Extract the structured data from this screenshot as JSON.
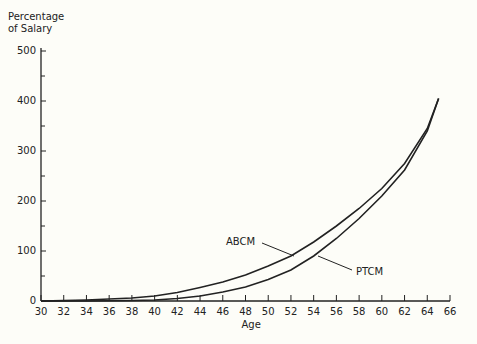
{
  "chart_data": {
    "type": "line",
    "title": "",
    "ylabel": "Percentage of Salary",
    "ylabel_lines": [
      "Percentage",
      "of Salary"
    ],
    "xlabel": "Age",
    "xlim": [
      30,
      66
    ],
    "ylim": [
      0,
      500
    ],
    "x_ticks": [
      30,
      32,
      34,
      36,
      38,
      40,
      42,
      44,
      46,
      48,
      50,
      52,
      54,
      56,
      58,
      60,
      62,
      64,
      66
    ],
    "y_ticks": [
      0,
      100,
      200,
      300,
      400,
      500
    ],
    "grid": false,
    "series": [
      {
        "name": "ABCM",
        "x": [
          30,
          34,
          38,
          40,
          42,
          44,
          46,
          48,
          50,
          52,
          54,
          56,
          58,
          60,
          62,
          64,
          65
        ],
        "values": [
          0,
          2,
          6,
          10,
          17,
          27,
          38,
          52,
          70,
          90,
          118,
          150,
          185,
          225,
          275,
          345,
          405
        ]
      },
      {
        "name": "PTCM",
        "x": [
          30,
          34,
          38,
          40,
          42,
          44,
          46,
          48,
          50,
          52,
          54,
          56,
          58,
          60,
          62,
          64,
          65
        ],
        "values": [
          0,
          0,
          1,
          2,
          5,
          10,
          18,
          28,
          43,
          62,
          90,
          125,
          165,
          210,
          262,
          340,
          405
        ]
      }
    ],
    "annotations": [
      {
        "text": "ABCM",
        "series": "ABCM"
      },
      {
        "text": "PTCM",
        "series": "PTCM"
      }
    ]
  }
}
